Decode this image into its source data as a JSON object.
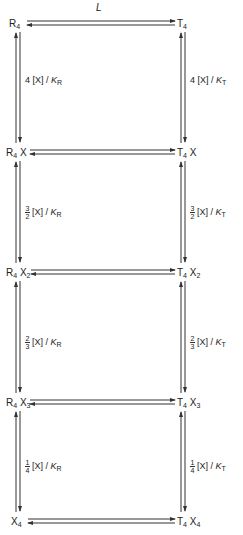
{
  "diagram": {
    "title_label": "L",
    "states": [
      {
        "left": {
          "base": "R",
          "sub": "4",
          "x": "",
          "xsub": ""
        },
        "right": {
          "base": "T",
          "sub": "4",
          "x": "",
          "xsub": ""
        }
      },
      {
        "left": {
          "base": "R",
          "sub": "4",
          "x": "X",
          "xsub": ""
        },
        "right": {
          "base": "T",
          "sub": "4",
          "x": "X",
          "xsub": ""
        }
      },
      {
        "left": {
          "base": "R",
          "sub": "4",
          "x": "X",
          "xsub": "2"
        },
        "right": {
          "base": "T",
          "sub": "4",
          "x": "X",
          "xsub": "2"
        }
      },
      {
        "left": {
          "base": "R",
          "sub": "4",
          "x": "X",
          "xsub": "3"
        },
        "right": {
          "base": "T",
          "sub": "4",
          "x": "X",
          "xsub": "3"
        }
      },
      {
        "left": {
          "base": "",
          "sub": "",
          "x": "X",
          "xsub": "4"
        },
        "right": {
          "base": "T",
          "sub": "4",
          "x": "X",
          "xsub": "4"
        }
      }
    ],
    "transitions": [
      {
        "left": {
          "coef": "4",
          "num": "",
          "den": "",
          "conc": "[X] /",
          "k": "K",
          "ksub": "R"
        },
        "right": {
          "coef": "4",
          "num": "",
          "den": "",
          "conc": "[X] /",
          "k": "K",
          "ksub": "T"
        }
      },
      {
        "left": {
          "coef": "",
          "num": "3",
          "den": "2",
          "conc": "[X] /",
          "k": "K",
          "ksub": "R"
        },
        "right": {
          "coef": "",
          "num": "3",
          "den": "2",
          "conc": "[X] /",
          "k": "K",
          "ksub": "T"
        }
      },
      {
        "left": {
          "coef": "",
          "num": "2",
          "den": "3",
          "conc": "[X] /",
          "k": "K",
          "ksub": "R"
        },
        "right": {
          "coef": "",
          "num": "2",
          "den": "3",
          "conc": "[X] /",
          "k": "K",
          "ksub": "T"
        }
      },
      {
        "left": {
          "coef": "",
          "num": "1",
          "den": "4",
          "conc": "[X] /",
          "k": "K",
          "ksub": "R"
        },
        "right": {
          "coef": "",
          "num": "1",
          "den": "4",
          "conc": "[X] /",
          "k": "K",
          "ksub": "T"
        }
      }
    ],
    "line_color": "#333333"
  }
}
